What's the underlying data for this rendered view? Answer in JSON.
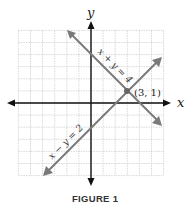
{
  "figure": {
    "caption": "FIGURE 1",
    "x_axis_label": "x",
    "y_axis_label": "y",
    "grid": {
      "xmin": -6,
      "xmax": 6,
      "ymin": -6,
      "ymax": 6,
      "step": 1
    },
    "lines": [
      {
        "equation": "x + y = 4",
        "color": "#777777"
      },
      {
        "equation": "x − y = 2",
        "color": "#777777"
      }
    ],
    "intersection": {
      "label": "(3, 1)",
      "x": 3,
      "y": 1
    }
  },
  "chart_data": {
    "type": "line",
    "title": "FIGURE 1",
    "xlabel": "x",
    "ylabel": "y",
    "xlim": [
      -6,
      6
    ],
    "ylim": [
      -6,
      6
    ],
    "grid": true,
    "series": [
      {
        "name": "x + y = 4",
        "x": [
          -2,
          6
        ],
        "y": [
          6,
          -2
        ]
      },
      {
        "name": "x − y = 2",
        "x": [
          -4,
          6
        ],
        "y": [
          -6,
          4
        ]
      }
    ],
    "annotations": [
      {
        "text": "(3, 1)",
        "x": 3,
        "y": 1
      }
    ]
  }
}
